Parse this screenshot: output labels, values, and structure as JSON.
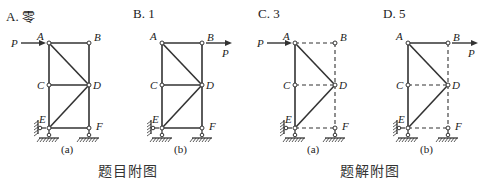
{
  "options": [
    {
      "label": "A. 零",
      "x": 6
    },
    {
      "label": "B. 1",
      "x": 133
    },
    {
      "label": "C. 3",
      "x": 258
    },
    {
      "label": "D. 5",
      "x": 383
    }
  ],
  "captions": {
    "problem": "题目附图",
    "solution": "题解附图"
  },
  "figures": [
    {
      "sub": "(a)",
      "ox": 49,
      "load_at": "A",
      "dashed": []
    },
    {
      "sub": "(b)",
      "ox": 162,
      "load_at": "B",
      "dashed": []
    },
    {
      "sub": "(a)",
      "ox": 295,
      "load_at": "A",
      "dashed": [
        "AB",
        "BD",
        "CD",
        "DF",
        "EF"
      ]
    },
    {
      "sub": "(b)",
      "ox": 408,
      "load_at": "B",
      "dashed": [
        "BD",
        "CD",
        "DF",
        "EF"
      ]
    }
  ],
  "nodes": {
    "A": "A",
    "B": "B",
    "C": "C",
    "D": "D",
    "E": "E",
    "F": "F"
  },
  "load_label": "P",
  "colors": {
    "line": "#333333",
    "bg": "#ffffff"
  }
}
